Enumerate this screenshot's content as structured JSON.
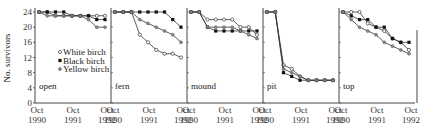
{
  "chart_data": {
    "type": "line",
    "title": "",
    "ylabel": "No. survivors",
    "ylim": [
      0,
      24
    ],
    "yticks": [
      0,
      4,
      8,
      12,
      16,
      20,
      24
    ],
    "x_tick_labels": [
      "Oct 1990",
      "Oct 1991",
      "Oct 1992"
    ],
    "legend": {
      "position": "inside open panel, middle-right",
      "entries": [
        {
          "name": "White birch",
          "marker": "open-circle"
        },
        {
          "name": "Black birch",
          "marker": "filled-square"
        },
        {
          "name": "Yellow birch",
          "marker": "gray-dot"
        }
      ]
    },
    "x": [
      0,
      0.25,
      0.5,
      0.75,
      1.0,
      1.25,
      1.5,
      1.75,
      2.0
    ],
    "panels": [
      {
        "name": "open",
        "series": [
          {
            "name": "White birch",
            "values": [
              24,
              24,
              23,
              23,
              23,
              23,
              23,
              23,
              23
            ]
          },
          {
            "name": "Black birch",
            "values": [
              24,
              24,
              24,
              24,
              23,
              23,
              23,
              22,
              22
            ]
          },
          {
            "name": "Yellow birch",
            "values": [
              24,
              23,
              23,
              23,
              23,
              23,
              22,
              20,
              20
            ]
          }
        ]
      },
      {
        "name": "fern",
        "series": [
          {
            "name": "White birch",
            "values": [
              24,
              24,
              24,
              18,
              16,
              14,
              13,
              13,
              12
            ]
          },
          {
            "name": "Black birch",
            "values": [
              24,
              24,
              24,
              24,
              24,
              24,
              24,
              22,
              20
            ]
          },
          {
            "name": "Yellow birch",
            "values": [
              24,
              24,
              24,
              22,
              21,
              20,
              19,
              18,
              16
            ]
          }
        ]
      },
      {
        "name": "mound",
        "series": [
          {
            "name": "White birch",
            "values": [
              24,
              24,
              22,
              22,
              22,
              22,
              20,
              20,
              18
            ]
          },
          {
            "name": "Black birch",
            "values": [
              24,
              24,
              20,
              19,
              19,
              19,
              19,
              19,
              19
            ]
          },
          {
            "name": "Yellow birch",
            "values": [
              24,
              24,
              20,
              20,
              20,
              20,
              19,
              18,
              17
            ]
          }
        ]
      },
      {
        "name": "pit",
        "series": [
          {
            "name": "White birch",
            "values": [
              24,
              24,
              10,
              9,
              7,
              6,
              6,
              6,
              6
            ]
          },
          {
            "name": "Black birch",
            "values": [
              24,
              24,
              8,
              7,
              6,
              6,
              6,
              6,
              6
            ]
          },
          {
            "name": "Yellow birch",
            "values": [
              24,
              24,
              9,
              8,
              7,
              6,
              6,
              6,
              6
            ]
          }
        ]
      },
      {
        "name": "top",
        "series": [
          {
            "name": "White birch",
            "values": [
              24,
              24,
              24,
              21,
              20,
              19,
              17,
              16,
              14
            ]
          },
          {
            "name": "Black birch",
            "values": [
              24,
              23,
              22,
              22,
              20,
              20,
              17,
              16,
              16
            ]
          },
          {
            "name": "Yellow birch",
            "values": [
              24,
              22,
              20,
              19,
              18,
              16,
              15,
              14,
              13
            ]
          }
        ]
      }
    ]
  },
  "colors": {
    "white_birch": "#ffffff",
    "black_birch": "#111111",
    "yellow_birch": "#888888",
    "axis": "#444444"
  }
}
